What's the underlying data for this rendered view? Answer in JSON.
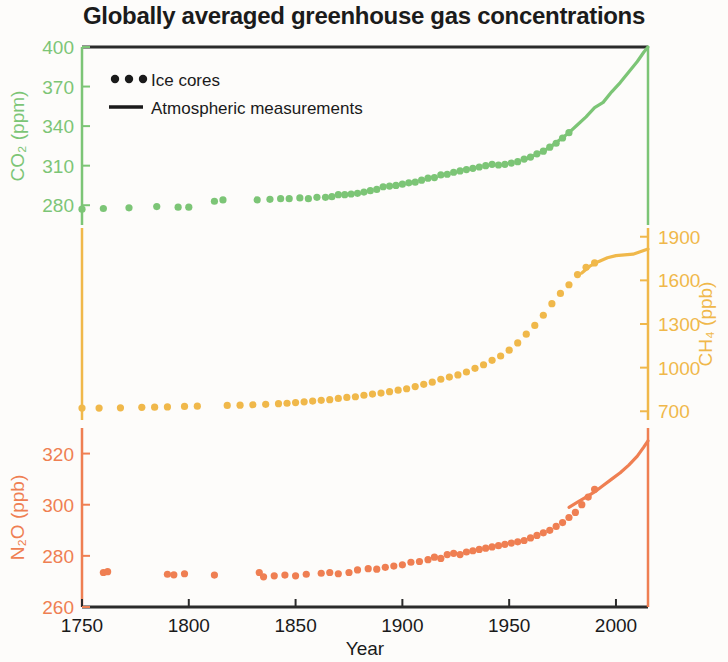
{
  "chart_data": {
    "type": "scatter",
    "title": "Globally averaged greenhouse gas concentrations",
    "xlabel": "Year",
    "xlim": [
      1750,
      2015
    ],
    "xticks": [
      1750,
      1800,
      1850,
      1900,
      1950,
      2000
    ],
    "grid": false,
    "legend": {
      "position": "top-left",
      "entries": [
        {
          "label": "Ice cores",
          "marker": "dots",
          "color": "#1a1a1a"
        },
        {
          "label": "Atmospheric measurements",
          "marker": "line",
          "color": "#1a1a1a"
        }
      ]
    },
    "panels": [
      {
        "name": "CO2",
        "ylabel": "CO₂ (ppm)",
        "ylabel_plain": "CO2 (ppm)",
        "units": "ppm",
        "color": "#7cc576",
        "axis_side": "left",
        "ylim": [
          265,
          400
        ],
        "yticks": [
          280,
          310,
          340,
          370,
          400
        ],
        "series": [
          {
            "name": "Ice cores",
            "marker": "dots",
            "x": [
              1750,
              1760,
              1772,
              1785,
              1795,
              1800,
              1812,
              1816,
              1832,
              1838,
              1843,
              1847,
              1852,
              1856,
              1860,
              1864,
              1867,
              1870,
              1873,
              1876,
              1879,
              1882,
              1885,
              1888,
              1891,
              1894,
              1897,
              1900,
              1903,
              1906,
              1909,
              1912,
              1915,
              1918,
              1921,
              1924,
              1927,
              1930,
              1933,
              1936,
              1939,
              1942,
              1945,
              1948,
              1951,
              1954,
              1957,
              1960,
              1963,
              1966,
              1969,
              1972,
              1975,
              1978
            ],
            "y": [
              277,
              277.5,
              278,
              279,
              278.5,
              278.5,
              283,
              284,
              284,
              284.5,
              285,
              285,
              285.5,
              285,
              286,
              286,
              286.5,
              288,
              288,
              288.5,
              289,
              290,
              291,
              292,
              294,
              294.5,
              295,
              296,
              297,
              297.5,
              299,
              300.5,
              301,
              303,
              303.5,
              305,
              306,
              307,
              308,
              309,
              310,
              311,
              310.5,
              311,
              312,
              313,
              315,
              316.5,
              319,
              321,
              324,
              327,
              331,
              335
            ]
          },
          {
            "name": "Atmospheric measurements",
            "marker": "line",
            "x": [
              1958,
              1962,
              1966,
              1970,
              1974,
              1978,
              1982,
              1986,
              1990,
              1994,
              1998,
              2002,
              2006,
              2010,
              2013,
              2015
            ],
            "y": [
              315,
              318,
              321,
              325,
              330,
              335,
              341,
              347,
              354,
              358,
              366,
              373,
              381,
              389,
              396,
              400
            ]
          }
        ]
      },
      {
        "name": "CH4",
        "ylabel": "CH₄ (ppb)",
        "ylabel_plain": "CH4 (ppb)",
        "units": "ppb",
        "color": "#f0b84a",
        "axis_side": "right",
        "ylim": [
          640,
          1960
        ],
        "yticks": [
          700,
          1000,
          1300,
          1600,
          1900
        ],
        "series": [
          {
            "name": "Ice cores",
            "marker": "dots",
            "x": [
              1750,
              1758,
              1768,
              1778,
              1784,
              1790,
              1798,
              1804,
              1818,
              1824,
              1830,
              1836,
              1842,
              1846,
              1850,
              1854,
              1858,
              1862,
              1866,
              1870,
              1874,
              1878,
              1882,
              1886,
              1890,
              1894,
              1898,
              1902,
              1906,
              1910,
              1914,
              1918,
              1922,
              1926,
              1930,
              1934,
              1938,
              1942,
              1946,
              1950,
              1954,
              1958,
              1962,
              1966,
              1970,
              1974,
              1978,
              1982,
              1986,
              1990
            ],
            "y": [
              722,
              722,
              724,
              727,
              728,
              730,
              733,
              735,
              740,
              742,
              745,
              748,
              752,
              755,
              760,
              765,
              770,
              775,
              780,
              788,
              795,
              800,
              810,
              818,
              825,
              835,
              845,
              855,
              870,
              885,
              900,
              920,
              935,
              950,
              970,
              995,
              1020,
              1050,
              1080,
              1120,
              1170,
              1230,
              1290,
              1360,
              1440,
              1510,
              1570,
              1640,
              1690,
              1720
            ]
          },
          {
            "name": "Atmospheric measurements",
            "marker": "line",
            "x": [
              1984,
              1988,
              1992,
              1996,
              2000,
              2004,
              2008,
              2012,
              2015
            ],
            "y": [
              1650,
              1700,
              1730,
              1755,
              1770,
              1775,
              1780,
              1800,
              1815
            ]
          }
        ]
      },
      {
        "name": "N2O",
        "ylabel": "N₂O (ppb)",
        "ylabel_plain": "N2O (ppb)",
        "units": "ppb",
        "color": "#ef7f52",
        "axis_side": "left",
        "ylim": [
          260,
          330
        ],
        "yticks": [
          260,
          280,
          300,
          320
        ],
        "series": [
          {
            "name": "Ice cores",
            "marker": "dots",
            "x": [
              1760,
              1762,
              1790,
              1793,
              1798,
              1812,
              1833,
              1835,
              1840,
              1845,
              1850,
              1855,
              1862,
              1866,
              1870,
              1875,
              1879,
              1884,
              1888,
              1892,
              1896,
              1900,
              1904,
              1908,
              1912,
              1915,
              1918,
              1921,
              1924,
              1927,
              1930,
              1933,
              1936,
              1939,
              1942,
              1945,
              1948,
              1951,
              1954,
              1957,
              1960,
              1963,
              1966,
              1969,
              1972,
              1975,
              1978,
              1981,
              1984,
              1987,
              1990
            ],
            "y": [
              273.5,
              273.8,
              272.8,
              272.6,
              273,
              272.5,
              273.5,
              271.8,
              272.2,
              272.5,
              272.2,
              272.8,
              273.2,
              273.5,
              273,
              273.5,
              274.5,
              275,
              274.8,
              275.5,
              276,
              276.5,
              277.5,
              277.8,
              278.5,
              279.5,
              279,
              280.5,
              281,
              280.5,
              281.5,
              282,
              282.5,
              283,
              283.5,
              284,
              284.5,
              285,
              285.5,
              286,
              287,
              288,
              289,
              290,
              291.5,
              293,
              295,
              297,
              300,
              303,
              306
            ]
          },
          {
            "name": "Atmospheric measurements",
            "marker": "line",
            "x": [
              1978,
              1982,
              1986,
              1990,
              1994,
              1998,
              2002,
              2006,
              2010,
              2013,
              2015
            ],
            "y": [
              299,
              301,
              303,
              305,
              307.5,
              310,
              312.5,
              315.5,
              319,
              322.5,
              325
            ]
          }
        ]
      }
    ]
  },
  "axis_colors": {
    "co2": "#7cc576",
    "ch4": "#f0b84a",
    "n2o": "#ef7f52",
    "frame": "#2b2b2b"
  }
}
